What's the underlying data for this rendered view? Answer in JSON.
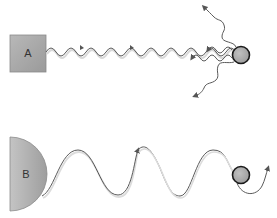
{
  "figure_a": {
    "source_label": "A",
    "source_shape": "square",
    "wave_type": "short-wavelength",
    "outcome": "scattered",
    "scatter_directions": [
      "up",
      "left",
      "left",
      "down"
    ]
  },
  "figure_b": {
    "source_label": "B",
    "source_shape": "half-disc",
    "wave_type": "long-wavelength",
    "outcome": "passes around particle"
  },
  "colors": {
    "source_fill": "#a8a8a8",
    "source_stroke": "#8a8a8a",
    "wave": "#555555",
    "wave_shadow": "#d0d0d0",
    "particle_fill": "#a9a9a9",
    "particle_stroke": "#1a1a1a"
  }
}
